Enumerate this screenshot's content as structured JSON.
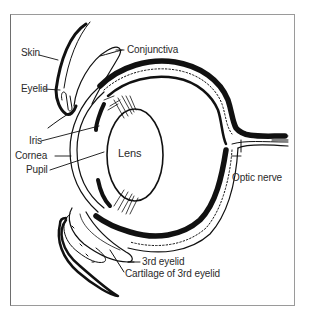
{
  "diagram": {
    "title": "",
    "labels": {
      "skin": "Skin",
      "conjunctiva": "Conjunctiva",
      "eyelid": "Eyelid",
      "iris": "Iris",
      "cornea": "Cornea",
      "lens": "Lens",
      "pupil": "Pupil",
      "optic_nerve": "Optic nerve",
      "third_eyelid": "3rd eyelid",
      "cartilage": "Cartilage of 3rd eyelid"
    },
    "colors": {
      "ink": "#111111",
      "label": "#2a2a2a",
      "frame": "#9a9a9a",
      "background": "#ffffff"
    }
  }
}
